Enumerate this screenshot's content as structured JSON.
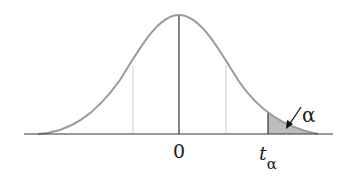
{
  "diagram": {
    "type": "t-distribution upper tail",
    "labels": {
      "center": "0",
      "critical_value": "t",
      "critical_subscript": "α",
      "tail_area": "α"
    },
    "colors": {
      "curve": "#9a9a9a",
      "axis": "#333333",
      "shade": "#bdbdbd",
      "dotted": "#c8c8c8"
    }
  }
}
